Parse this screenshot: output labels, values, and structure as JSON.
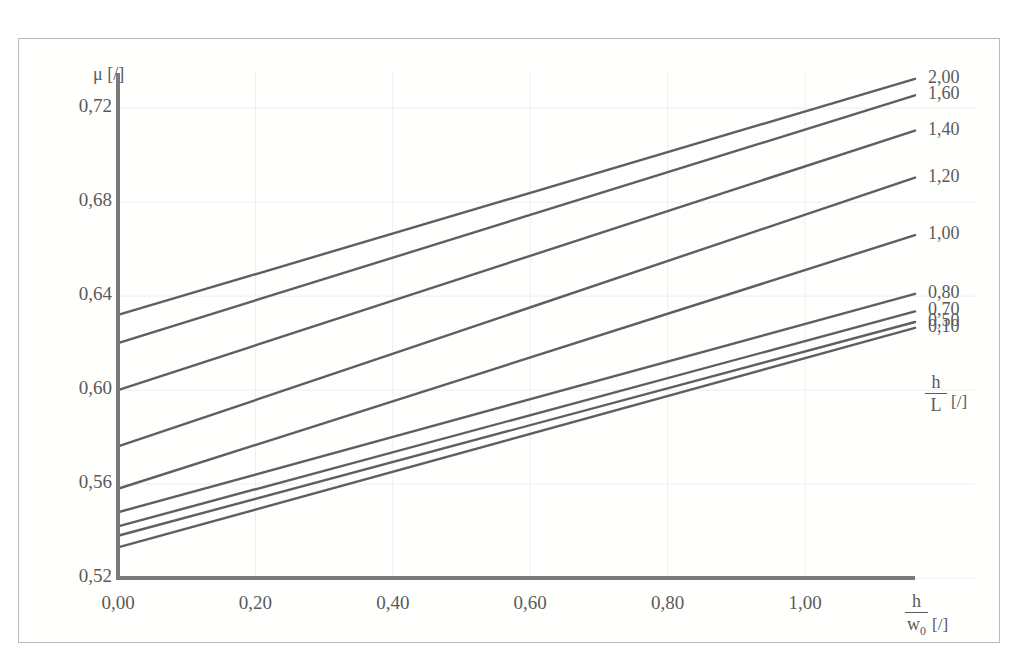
{
  "figure": {
    "background_color": "#ffffff",
    "frame_color": "#b9b9b9",
    "line_color": "#5f5f5f",
    "axis_color": "#7a7a7a",
    "grid_color": "#eeeeee",
    "text_color": "#5a5a5a"
  },
  "axes": {
    "y_axis_title_symbol": "μ",
    "y_axis_title_unit": "[/]",
    "x_axis_title_num": "h",
    "x_axis_title_den": "w",
    "x_axis_title_den_sub": "0",
    "x_axis_title_unit": "[/]",
    "legend_title_num": "h",
    "legend_title_den": "L",
    "legend_title_unit": "[/]"
  },
  "chart_data": {
    "type": "line",
    "title": "",
    "subtitle": "",
    "xlabel": "h/w0 [/]",
    "ylabel": "μ [/]",
    "legend_title": "h/L [/]",
    "legend_position": "right",
    "grid": true,
    "xlim": [
      0.0,
      1.16
    ],
    "ylim": [
      0.52,
      0.735
    ],
    "xticks": [
      0.0,
      0.2,
      0.4,
      0.6,
      0.8,
      1.0
    ],
    "xtick_labels": [
      "0,00",
      "0,20",
      "0,40",
      "0,60",
      "0,80",
      "1,00"
    ],
    "yticks": [
      0.52,
      0.56,
      0.6,
      0.64,
      0.68,
      0.72
    ],
    "ytick_labels": [
      "0,52",
      "0,56",
      "0,60",
      "0,64",
      "0,68",
      "0,72"
    ],
    "x": [
      0.0,
      1.16
    ],
    "series": [
      {
        "name": "2,00",
        "label": "2,00",
        "values": [
          0.632,
          0.7325
        ]
      },
      {
        "name": "1,60",
        "label": "1,60",
        "values": [
          0.62,
          0.7255
        ]
      },
      {
        "name": "1,40",
        "label": "1,40",
        "values": [
          0.6,
          0.7105
        ]
      },
      {
        "name": "1,20",
        "label": "1,20",
        "values": [
          0.576,
          0.6905
        ]
      },
      {
        "name": "1,00",
        "label": "1,00",
        "values": [
          0.558,
          0.666
        ]
      },
      {
        "name": "0,80",
        "label": "0,80",
        "values": [
          0.548,
          0.641
        ]
      },
      {
        "name": "0,70",
        "label": "0,70",
        "values": [
          0.542,
          0.6335
        ]
      },
      {
        "name": "0,50",
        "label": "0,50",
        "values": [
          0.538,
          0.629
        ]
      },
      {
        "name": "0,10",
        "label": "0,10",
        "values": [
          0.533,
          0.6265
        ]
      }
    ]
  },
  "right_labels": [
    {
      "text": "2,00",
      "series": "2,00"
    },
    {
      "text": "1,60",
      "series": "1,60"
    },
    {
      "text": "1,40",
      "series": "1,40"
    },
    {
      "text": "1,20",
      "series": "1,20"
    },
    {
      "text": "1,00",
      "series": "1,00"
    },
    {
      "text": "0,80",
      "series": "0,80"
    },
    {
      "text": "0,70",
      "series": "0,70"
    },
    {
      "text": "0,50",
      "series": "0,50"
    },
    {
      "text": "0,10",
      "series": "0,10"
    }
  ]
}
